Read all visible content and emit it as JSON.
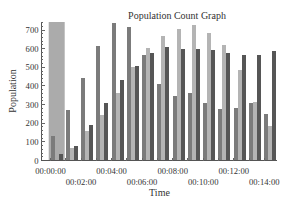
{
  "chart_data": {
    "type": "bar",
    "title": "Population Count Graph",
    "xlabel": "Time",
    "ylabel": "Population",
    "categories": [
      "00:00:00",
      "00:01:00",
      "00:02:00",
      "00:03:00",
      "00:04:00",
      "00:05:00",
      "00:06:00",
      "00:07:00",
      "00:08:00",
      "00:09:00",
      "00:10:00",
      "00:11:00",
      "00:12:00",
      "00:13:00",
      "00:14:00"
    ],
    "x_tick_labels": [
      "00:00:00",
      "00:02:00",
      "00:04:00",
      "00:06:00",
      "00:08:00",
      "00:10:00",
      "00:12:00",
      "00:14:00"
    ],
    "y_ticks": [
      0,
      100,
      200,
      300,
      400,
      500,
      600,
      700
    ],
    "ylim": [
      0,
      743
    ],
    "grid": false,
    "legend": null,
    "series": [
      {
        "name": "",
        "color": "#7b7b7b",
        "values": [
          130,
          270,
          440,
          614,
          740,
          718,
          568,
          413,
          346,
          363,
          306,
          274,
          284,
          309,
          247
        ]
      },
      {
        "name": "",
        "color": "#b4b4b4",
        "values": [
          null,
          67,
          158,
          243,
          364,
          502,
          603,
          667,
          703,
          725,
          684,
          617,
          488,
          314,
          185
        ]
      },
      {
        "name": "",
        "color": "#565656",
        "values": [
          37,
          80,
          188,
          309,
          431,
          505,
          578,
          609,
          600,
          600,
          595,
          577,
          564,
          568,
          587
        ]
      }
    ],
    "highlight": {
      "category_index": 0,
      "color": "#ababab"
    }
  }
}
